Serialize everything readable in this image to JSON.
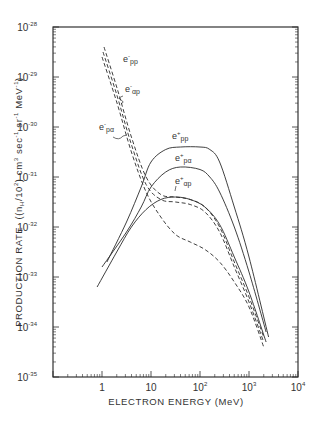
{
  "chart_data": {
    "type": "line",
    "title": "",
    "xlabel": "ELECTRON ENERGY (MeV)",
    "ylabel": "PRODUCTION RATE ((n_H/10^2) cm^3 sec^-1 sr^-1 MeV^-1)",
    "xscale": "log",
    "yscale": "log",
    "xlim": [
      0.1,
      10000
    ],
    "ylim": [
      1e-35,
      1e-28
    ],
    "grid": false,
    "x_ticks": [
      {
        "base": "1",
        "exp": "",
        "value": 1
      },
      {
        "base": "10",
        "exp": "",
        "value": 10
      },
      {
        "base": "10",
        "exp": "2",
        "value": 100
      },
      {
        "base": "10",
        "exp": "3",
        "value": 1000
      },
      {
        "base": "10",
        "exp": "4",
        "value": 10000
      }
    ],
    "y_ticks": [
      {
        "base": "10",
        "exp": "-28",
        "value": -28
      },
      {
        "base": "10",
        "exp": "-29",
        "value": -29
      },
      {
        "base": "10",
        "exp": "-30",
        "value": -30
      },
      {
        "base": "10",
        "exp": "-31",
        "value": -31
      },
      {
        "base": "10",
        "exp": "-32",
        "value": -32
      },
      {
        "base": "10",
        "exp": "-33",
        "value": -33
      },
      {
        "base": "10",
        "exp": "-34",
        "value": -34
      },
      {
        "base": "10",
        "exp": "-35",
        "value": -35
      }
    ],
    "series_note": "values are log10(production rate) at log10(energy MeV)",
    "series": [
      {
        "name": "e+ pp",
        "style": "solid",
        "log_x": [
          0.1,
          0.5,
          0.8,
          1.0,
          1.3,
          1.6,
          2.0,
          2.2,
          2.4,
          2.7,
          3.0,
          3.4
        ],
        "log_y": [
          -32.7,
          -31.9,
          -31.2,
          -30.7,
          -30.45,
          -30.4,
          -30.4,
          -30.45,
          -30.7,
          -31.6,
          -32.6,
          -34.2
        ]
      },
      {
        "name": "e+ pα",
        "style": "solid",
        "log_x": [
          0.0,
          0.5,
          0.8,
          1.0,
          1.3,
          1.6,
          2.0,
          2.2,
          2.4,
          2.7,
          3.0,
          3.35
        ],
        "log_y": [
          -32.8,
          -32.1,
          -31.6,
          -31.2,
          -30.9,
          -30.8,
          -30.85,
          -31.0,
          -31.3,
          -32.0,
          -32.9,
          -34.1
        ]
      },
      {
        "name": "e+ αp",
        "style": "solid",
        "log_x": [
          -0.1,
          0.3,
          0.6,
          0.9,
          1.2,
          1.5,
          1.8,
          2.1,
          2.4,
          2.7,
          3.0,
          3.35
        ],
        "log_y": [
          -33.2,
          -32.5,
          -32.0,
          -31.65,
          -31.45,
          -31.4,
          -31.45,
          -31.6,
          -31.95,
          -32.6,
          -33.3,
          -34.3
        ]
      },
      {
        "name": "e- pp",
        "style": "dashed",
        "log_x": [
          0.04,
          0.3,
          0.6,
          0.9,
          1.2,
          1.5,
          1.8,
          2.1,
          2.4,
          2.7,
          3.0,
          3.3
        ],
        "log_y": [
          -28.4,
          -29.2,
          -30.2,
          -31.0,
          -31.35,
          -31.4,
          -31.45,
          -31.6,
          -32.0,
          -32.7,
          -33.4,
          -34.2
        ]
      },
      {
        "name": "e- αp",
        "style": "dashed",
        "log_x": [
          0.02,
          0.3,
          0.6,
          0.9,
          1.2,
          1.5,
          1.8,
          2.1,
          2.4,
          2.7,
          3.0,
          3.3
        ],
        "log_y": [
          -28.5,
          -29.35,
          -30.35,
          -31.15,
          -31.45,
          -31.5,
          -31.55,
          -31.7,
          -32.1,
          -32.8,
          -33.5,
          -34.3
        ]
      },
      {
        "name": "e- pα",
        "style": "dashed",
        "log_x": [
          0.0,
          0.3,
          0.6,
          0.9,
          1.2,
          1.5,
          1.8,
          2.1,
          2.4,
          2.7,
          3.0,
          3.3
        ],
        "log_y": [
          -28.6,
          -29.5,
          -30.5,
          -31.3,
          -31.8,
          -32.15,
          -32.3,
          -32.45,
          -32.7,
          -33.1,
          -33.6,
          -34.4
        ]
      }
    ],
    "annotations": [
      {
        "text": "e-pp",
        "sign": "-",
        "sub": "pp"
      },
      {
        "text": "e-αp",
        "sign": "-",
        "sub": "αp"
      },
      {
        "text": "e-pα",
        "sign": "-",
        "sub": "pα"
      },
      {
        "text": "e+pp",
        "sign": "+",
        "sub": "pp"
      },
      {
        "text": "e+pα",
        "sign": "+",
        "sub": "pα"
      },
      {
        "text": "e+αp",
        "sign": "+",
        "sub": "αp"
      }
    ]
  },
  "axes": {
    "x_title": "ELECTRON  ENERGY (MeV)",
    "y_title_prefix": "PRODUCTION RATE",
    "y_title_units": "((n",
    "y_title_sub_h": "H",
    "y_title_units2": "/10",
    "y_title_units2_sup": "2",
    "y_title_units3": ") cm",
    "y_title_units3_sup": "3",
    "y_title_units4": " sec",
    "y_title_units4_sup": "-1",
    "y_title_units5": " sr",
    "y_title_units5_sup": "-1",
    "y_title_units6": " MeV",
    "y_title_units6_sup": "-1",
    "y_title_close": ")"
  },
  "labels": {
    "e_minus_pp": {
      "e": "e",
      "sign": "-",
      "sub": "pp"
    },
    "e_minus_ap": {
      "e": "e",
      "sign": "-",
      "sub": "αp"
    },
    "e_minus_pa": {
      "e": "e",
      "sign": "-",
      "sub": "pα"
    },
    "e_plus_pp": {
      "e": "e",
      "sign": "+",
      "sub": "pp"
    },
    "e_plus_pa": {
      "e": "e",
      "sign": "+",
      "sub": "pα"
    },
    "e_plus_ap": {
      "e": "e",
      "sign": "+",
      "sub": "αp"
    }
  },
  "colors": {
    "ink": "#2a2a2a",
    "frame": "#333333",
    "background": "#ffffff"
  }
}
